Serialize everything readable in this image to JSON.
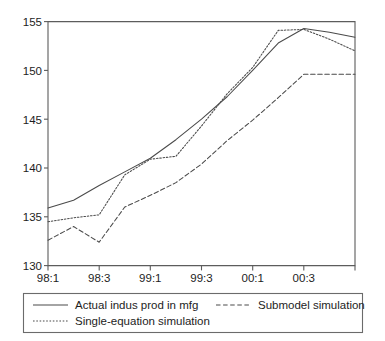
{
  "chart_data": {
    "type": "line",
    "title": "",
    "xlabel": "",
    "ylabel": "",
    "x": [
      "98:1",
      "98:2",
      "98:3",
      "98:4",
      "99:1",
      "99:2",
      "99:3",
      "99:4",
      "00:1",
      "00:2",
      "00:3",
      "00:4",
      "01:1"
    ],
    "categories": [
      "98:1",
      "98:2",
      "98:3",
      "98:4",
      "99:1",
      "99:2",
      "99:3",
      "99:4",
      "00:1",
      "00:2",
      "00:3",
      "00:4",
      "01:1"
    ],
    "xtick_labels": [
      "98:1",
      "98:3",
      "99:1",
      "99:3",
      "00:1",
      "00:3"
    ],
    "ytick_labels": [
      "130",
      "135",
      "140",
      "145",
      "150",
      "155"
    ],
    "yticks": [
      130,
      135,
      140,
      145,
      150,
      155
    ],
    "ylim": [
      130,
      155
    ],
    "grid": false,
    "legend_position": "below-axis",
    "series": [
      {
        "name": "Actual indus prod in mfg",
        "style": "solid",
        "color": "#4a4a4a",
        "values": [
          135.9,
          136.7,
          138.2,
          139.6,
          141.0,
          142.9,
          145.0,
          147.3,
          150.0,
          152.8,
          154.3,
          153.9,
          153.4
        ]
      },
      {
        "name": "Single-equation simulation",
        "style": "dotted",
        "color": "#4a4a4a",
        "values": [
          134.5,
          134.9,
          135.2,
          139.3,
          140.9,
          141.2,
          144.3,
          147.6,
          150.3,
          154.1,
          154.2,
          153.2,
          152.0
        ]
      },
      {
        "name": "Submodel simulation",
        "style": "dashed",
        "color": "#4a4a4a",
        "values": [
          132.6,
          134.0,
          132.4,
          136.0,
          137.2,
          138.5,
          140.4,
          142.8,
          144.9,
          147.2,
          149.6,
          149.6,
          149.6
        ]
      }
    ]
  },
  "legend": {
    "entries": [
      {
        "label": "Actual indus prod in mfg",
        "style": "solid"
      },
      {
        "label": "Submodel simulation",
        "style": "dashed"
      },
      {
        "label": "Single-equation simulation",
        "style": "dotted"
      }
    ]
  }
}
